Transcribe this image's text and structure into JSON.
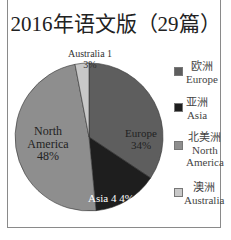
{
  "chart_data": {
    "type": "pie",
    "title": "2016年语文版（29篇）",
    "categories": [
      "Europe",
      "Asia",
      "North America",
      "Australia"
    ],
    "labels_zh": [
      "欧洲",
      "亚洲",
      "北美洲",
      "澳洲"
    ],
    "values": [
      34,
      14,
      48,
      3
    ],
    "counts": [
      null,
      4,
      null,
      1
    ],
    "slice_labels": [
      "Europe 34%",
      "Asia 4 4%",
      "North America 48%",
      "Australia 1 3%"
    ],
    "colors": [
      "#5e5e5e",
      "#1e1e1e",
      "#8e8e8e",
      "#c8c8c8"
    ],
    "legend_position": "right"
  },
  "title": "2016年语文版（29篇）",
  "slices": {
    "europe": {
      "name": "Europe",
      "pct": "34%"
    },
    "asia": {
      "text": "Asia 4 4%"
    },
    "north_america": {
      "line1": "North",
      "line2": "America",
      "pct": "48%"
    },
    "australia": {
      "line1": "Australia 1",
      "pct": "3%"
    }
  },
  "legend": [
    {
      "zh": "欧洲",
      "en": "Europe",
      "color": "#5e5e5e"
    },
    {
      "zh": "亚洲",
      "en": "Asia",
      "color": "#1e1e1e"
    },
    {
      "zh": "北美洲",
      "en": "North",
      "en2": "America",
      "color": "#8e8e8e"
    },
    {
      "zh": "澳洲",
      "en": "Australia",
      "color": "#c8c8c8"
    }
  ]
}
